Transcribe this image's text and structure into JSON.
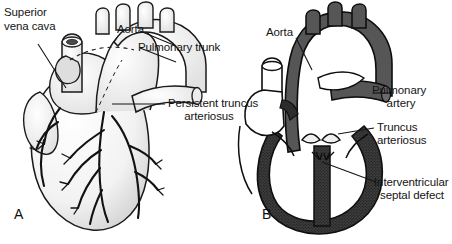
{
  "figure": {
    "title": "Persistent truncus arteriosus",
    "background_color": "#ffffff",
    "ink_color": "#141414",
    "gray_fill": "#565656",
    "dark_fill": "#3a3a3a"
  },
  "panels": [
    {
      "letter": "A",
      "view": "external anterior view of heart with great vessels",
      "labels": [
        {
          "id": "superior-vena-cava",
          "lines": [
            "Superior",
            "vena cava"
          ],
          "align": "left"
        },
        {
          "id": "aorta",
          "lines": [
            "Aorta"
          ],
          "align": "left"
        },
        {
          "id": "pulmonary-trunk",
          "lines": [
            "Pulmonary trunk"
          ],
          "align": "left"
        },
        {
          "id": "persistent-truncus-arteriosus",
          "lines": [
            "Persistent truncus",
            "arteriosus"
          ],
          "align": "center"
        }
      ]
    },
    {
      "letter": "B",
      "view": "coronal cross-section showing interior chambers",
      "labels": [
        {
          "id": "aorta",
          "lines": [
            "Aorta"
          ],
          "align": "left"
        },
        {
          "id": "pulmonary-artery",
          "lines": [
            "Pulmonary",
            "artery"
          ],
          "align": "center"
        },
        {
          "id": "truncus-arteriosus",
          "lines": [
            "Truncus",
            "arteriosus"
          ],
          "align": "left"
        },
        {
          "id": "interventricular-septal-defect",
          "lines": [
            "Interventricular",
            "septal defect"
          ],
          "align": "center"
        }
      ]
    }
  ],
  "label_text": {
    "a_svc_l1": "Superior",
    "a_svc_l2": "vena cava",
    "a_aorta": "Aorta",
    "a_pulm_trunk": "Pulmonary trunk",
    "a_truncus_l1": "Persistent truncus",
    "a_truncus_l2": "arteriosus",
    "b_aorta": "Aorta",
    "b_pulm_art_l1": "Pulmonary",
    "b_pulm_art_l2": "artery",
    "b_truncus_l1": "Truncus",
    "b_truncus_l2": "arteriosus",
    "b_vsd_l1": "Interventricular",
    "b_vsd_l2": "septal defect",
    "letter_a": "A",
    "letter_b": "B"
  }
}
